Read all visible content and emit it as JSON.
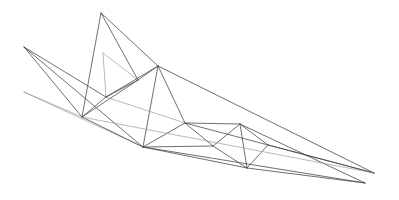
{
  "figure": {
    "type": "line-drawing",
    "canvas": {
      "width": 399,
      "height": 200,
      "background_color": "#ffffff"
    },
    "style": {
      "stroke_color": "#4a4a4a",
      "stroke_color_light": "#8a8a8a",
      "stroke_width": 0.8,
      "stroke_width_light": 0.6
    },
    "vertices": [
      {
        "id": "v0",
        "name": "top-apex",
        "x": 101,
        "y": 13
      },
      {
        "id": "v1",
        "name": "left-apex",
        "x": 24,
        "y": 47
      },
      {
        "id": "v2",
        "name": "upper-mid-apex",
        "x": 103,
        "y": 53
      },
      {
        "id": "v3",
        "name": "lower-left-tail",
        "x": 24,
        "y": 92
      },
      {
        "id": "v4",
        "name": "upper-ridge-node",
        "x": 158,
        "y": 66
      },
      {
        "id": "v5",
        "name": "mid-upper-node",
        "x": 138,
        "y": 80
      },
      {
        "id": "v6",
        "name": "mid-left-node",
        "x": 106,
        "y": 97
      },
      {
        "id": "v7",
        "name": "left-junction",
        "x": 82,
        "y": 117
      },
      {
        "id": "v8",
        "name": "lower-center-node",
        "x": 143,
        "y": 147
      },
      {
        "id": "v9",
        "name": "center-right-node",
        "x": 185,
        "y": 123
      },
      {
        "id": "v10",
        "name": "right-upper-node",
        "x": 240,
        "y": 124
      },
      {
        "id": "v11",
        "name": "right-mid-node",
        "x": 213,
        "y": 146
      },
      {
        "id": "v12",
        "name": "right-far-node",
        "x": 268,
        "y": 145
      },
      {
        "id": "v13",
        "name": "bottom-right-node",
        "x": 247,
        "y": 168
      },
      {
        "id": "v14",
        "name": "right-convergence-top",
        "x": 374,
        "y": 173
      },
      {
        "id": "v15",
        "name": "right-convergence-bot",
        "x": 365,
        "y": 183
      }
    ],
    "edges": [
      {
        "from": "v0",
        "to": "v7",
        "weight": "normal"
      },
      {
        "from": "v0",
        "to": "v5",
        "weight": "normal"
      },
      {
        "from": "v0",
        "to": "v4",
        "weight": "normal"
      },
      {
        "from": "v1",
        "to": "v7",
        "weight": "normal"
      },
      {
        "from": "v1",
        "to": "v8",
        "weight": "normal"
      },
      {
        "from": "v1",
        "to": "v6",
        "weight": "normal"
      },
      {
        "from": "v2",
        "to": "v6",
        "weight": "light"
      },
      {
        "from": "v2",
        "to": "v5",
        "weight": "light"
      },
      {
        "from": "v3",
        "to": "v7",
        "weight": "light"
      },
      {
        "from": "v3",
        "to": "v8",
        "weight": "light"
      },
      {
        "from": "v4",
        "to": "v5",
        "weight": "normal"
      },
      {
        "from": "v4",
        "to": "v6",
        "weight": "normal"
      },
      {
        "from": "v4",
        "to": "v8",
        "weight": "normal"
      },
      {
        "from": "v4",
        "to": "v9",
        "weight": "normal"
      },
      {
        "from": "v4",
        "to": "v14",
        "weight": "normal"
      },
      {
        "from": "v5",
        "to": "v6",
        "weight": "normal"
      },
      {
        "from": "v5",
        "to": "v7",
        "weight": "normal"
      },
      {
        "from": "v6",
        "to": "v7",
        "weight": "normal"
      },
      {
        "from": "v7",
        "to": "v8",
        "weight": "normal"
      },
      {
        "from": "v8",
        "to": "v9",
        "weight": "normal"
      },
      {
        "from": "v8",
        "to": "v11",
        "weight": "normal"
      },
      {
        "from": "v8",
        "to": "v13",
        "weight": "normal"
      },
      {
        "from": "v8",
        "to": "v15",
        "weight": "normal"
      },
      {
        "from": "v9",
        "to": "v10",
        "weight": "normal"
      },
      {
        "from": "v9",
        "to": "v11",
        "weight": "normal"
      },
      {
        "from": "v9",
        "to": "v14",
        "weight": "normal"
      },
      {
        "from": "v10",
        "to": "v11",
        "weight": "normal"
      },
      {
        "from": "v10",
        "to": "v12",
        "weight": "normal"
      },
      {
        "from": "v10",
        "to": "v13",
        "weight": "normal"
      },
      {
        "from": "v10",
        "to": "v15",
        "weight": "normal"
      },
      {
        "from": "v11",
        "to": "v13",
        "weight": "normal"
      },
      {
        "from": "v12",
        "to": "v13",
        "weight": "normal"
      },
      {
        "from": "v12",
        "to": "v14",
        "weight": "normal"
      },
      {
        "from": "v13",
        "to": "v15",
        "weight": "normal"
      },
      {
        "from": "v7",
        "to": "v14",
        "weight": "light"
      },
      {
        "from": "v6",
        "to": "v9",
        "weight": "light"
      }
    ]
  }
}
